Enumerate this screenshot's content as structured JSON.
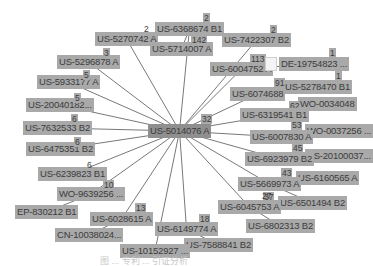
{
  "center": {
    "id": "US-5014076 A",
    "count": "32",
    "x": 148,
    "y": 124
  },
  "nodes": [
    {
      "id": "US-5270742 A",
      "count": "2",
      "x": 95,
      "y": 32,
      "cx": 143,
      "cy": 24,
      "cplain": true
    },
    {
      "id": "US-6368674 B1",
      "count": "2",
      "x": 155,
      "y": 22,
      "cx": 203,
      "cy": 13
    },
    {
      "id": "US-5714007 A",
      "count": "142",
      "x": 150,
      "y": 42,
      "cx": 191,
      "cy": 35
    },
    {
      "id": "US-7422307 B2",
      "count": "2",
      "x": 222,
      "y": 33,
      "cx": 270,
      "cy": 25
    },
    {
      "id": "US-6004752 A",
      "count": "113",
      "x": 210,
      "y": 62,
      "cx": 250,
      "cy": 54
    },
    {
      "id": "DE-19754823 ...",
      "count": "1",
      "x": 279,
      "y": 57,
      "cx": 329,
      "cy": 48
    },
    {
      "id": "US-5278470 B1",
      "count": "1",
      "x": 283,
      "y": 80,
      "cx": 335,
      "cy": 71
    },
    {
      "id": "US-6074688",
      "count": "91",
      "x": 230,
      "y": 87,
      "cx": 274,
      "cy": 78
    },
    {
      "id": "WO-0034048",
      "count": "62",
      "x": 298,
      "y": 97,
      "cx": 289,
      "cy": 101
    },
    {
      "id": "US-6319541 B1",
      "count": "",
      "x": 240,
      "y": 108,
      "cx": 0,
      "cy": 0
    },
    {
      "id": "WO-0037256 ...",
      "count": "53",
      "x": 305,
      "y": 124,
      "cx": 291,
      "cy": 120
    },
    {
      "id": "US-6007830 A",
      "count": "",
      "x": 250,
      "y": 130,
      "cx": 0,
      "cy": 0
    },
    {
      "id": "US-20100037...",
      "count": "45",
      "x": 305,
      "y": 149,
      "cx": 292,
      "cy": 143
    },
    {
      "id": "US-6923979 B2",
      "count": "",
      "x": 245,
      "y": 152,
      "cx": 0,
      "cy": 0
    },
    {
      "id": "US-6160565 A",
      "count": "43",
      "x": 296,
      "y": 171,
      "cx": 281,
      "cy": 168
    },
    {
      "id": "US-5669973 A",
      "count": "",
      "x": 238,
      "y": 177,
      "cx": 0,
      "cy": 0
    },
    {
      "id": "US-6501494 B2",
      "count": "37",
      "x": 278,
      "y": 196,
      "cx": 263,
      "cy": 192
    },
    {
      "id": "US-6045753 A",
      "count": "27",
      "x": 218,
      "y": 200,
      "cx": 261,
      "cy": 191,
      "cplain": true
    },
    {
      "id": "US-6802313 B2",
      "count": "",
      "x": 246,
      "y": 219,
      "cx": 0,
      "cy": 0
    },
    {
      "id": "US-6149774 A",
      "count": "18",
      "x": 155,
      "y": 222,
      "cx": 199,
      "cy": 214
    },
    {
      "id": "US-7588841 B2",
      "count": "",
      "x": 184,
      "y": 238,
      "cx": 0,
      "cy": 0
    },
    {
      "id": "US-10152927 ...",
      "count": "",
      "x": 120,
      "y": 244,
      "cx": 0,
      "cy": 0
    },
    {
      "id": "US-6028615 A",
      "count": "13",
      "x": 90,
      "y": 212,
      "cx": 135,
      "cy": 203
    },
    {
      "id": "CN-10038024...",
      "count": "",
      "x": 55,
      "y": 228,
      "cx": 0,
      "cy": 0
    },
    {
      "id": "WO-9639256 ...",
      "count": "10",
      "x": 57,
      "y": 187,
      "cx": 103,
      "cy": 180
    },
    {
      "id": "EP-830212 B1",
      "count": "",
      "x": 15,
      "y": 205,
      "cx": 0,
      "cy": 0
    },
    {
      "id": "US-6239823 B1",
      "count": "6",
      "x": 38,
      "y": 167,
      "cx": 86,
      "cy": 160,
      "cplain": true
    },
    {
      "id": "US-6475351 B2",
      "count": "6",
      "x": 26,
      "y": 142,
      "cx": 74,
      "cy": 137
    },
    {
      "id": "US-7632533 B2",
      "count": "6",
      "x": 23,
      "y": 121,
      "cx": 71,
      "cy": 114
    },
    {
      "id": "US-20040182...",
      "count": "5",
      "x": 26,
      "y": 98,
      "cx": 74,
      "cy": 93
    },
    {
      "id": "US-5933177 A",
      "count": "5",
      "x": 37,
      "y": 75,
      "cx": 83,
      "cy": 70
    },
    {
      "id": "US-5296878 A",
      "count": "3",
      "x": 57,
      "y": 55,
      "cx": 103,
      "cy": 48
    }
  ],
  "links": [
    {
      "from": "US-6368674 B1",
      "to": "US-5714007 A"
    },
    {
      "from": "US-6004752 A",
      "to": "DE-19754823 ..."
    },
    {
      "from": "US-6074688",
      "to": "US-5278470 B1"
    },
    {
      "from": "US-6319541 B1",
      "to": "WO-0034048"
    },
    {
      "from": "US-6007830 A",
      "to": "WO-0037256 ..."
    },
    {
      "from": "US-6923979 B2",
      "to": "US-20100037..."
    },
    {
      "from": "US-5669973 A",
      "to": "US-6160565 A"
    },
    {
      "from": "US-5669973 A",
      "to": "US-6501494 B2"
    },
    {
      "from": "US-6045753 A",
      "to": "US-6802313 B2"
    },
    {
      "from": "US-6149774 A",
      "to": "US-7588841 B2"
    },
    {
      "from": "WO-9639256 ...",
      "to": "EP-830212 B1"
    },
    {
      "from": "US-6028615 A",
      "to": "CN-10038024..."
    }
  ],
  "caption": "图 ... 专利 ... 引证分析"
}
